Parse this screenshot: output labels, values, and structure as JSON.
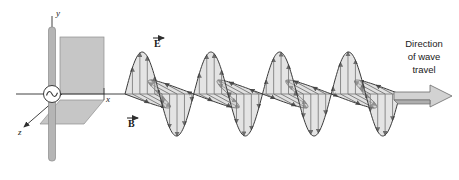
{
  "figure": {
    "background_color": "#ffffff",
    "stroke_color": "#3a3a3a",
    "fill_gray": "#c9c9c9",
    "rod_gray": "#b0b0b0",
    "plane_gray": "#c4c4c4"
  },
  "axes": {
    "x_label": "x",
    "y_label": "y",
    "z_label": "z"
  },
  "source": {
    "name": "ac-source",
    "symbol": "sine",
    "rod_label": "antenna"
  },
  "fields": {
    "electric_label": "E",
    "magnetic_label": "B",
    "electric_overbar": "⃗",
    "magnetic_overbar": "⃗"
  },
  "annotation": {
    "line1": "Direction",
    "line2": "of wave",
    "line3": "travel"
  },
  "chart_data": {
    "type": "line",
    "xlabel": "x",
    "ylabel": "y",
    "zlabel": "z",
    "grid": false,
    "legend": [
      "E",
      "B"
    ],
    "x_start_px": 125,
    "x_end_px": 400,
    "axis_y_px": 94,
    "wavelength_px": 68.75,
    "cycles": 4,
    "amplitude_E_px": 42,
    "amplitude_B_px": 36,
    "B_skew_x_px": 26,
    "B_skew_y_px": 14,
    "series": [
      {
        "name": "E",
        "orientation": "vertical (xy-plane)",
        "arrow_count": 36,
        "function": "E(x) = A sin(2πx/λ)"
      },
      {
        "name": "B",
        "orientation": "diagonal (xz-plane, perspective)",
        "arrow_count": 36,
        "function": "B(x) = A sin(2πx/λ)"
      }
    ]
  }
}
